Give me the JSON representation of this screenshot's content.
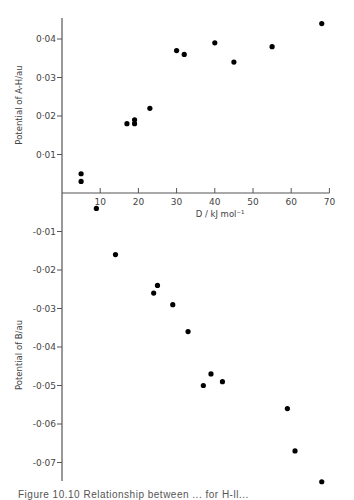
{
  "chart_data": {
    "type": "scatter",
    "title": "",
    "xlabel": "D / kJ mol⁻¹",
    "ylabel_top": "Potential of A-H/au",
    "ylabel_bottom": "Potential of B/au",
    "xlim": [
      0,
      70
    ],
    "ylim": [
      -0.076,
      0.045
    ],
    "x_ticks": [
      10,
      20,
      30,
      40,
      50,
      60,
      70
    ],
    "x_tick_labels": [
      "10",
      "20",
      "30",
      "40",
      "50",
      "60",
      "70"
    ],
    "y_ticks": [
      0.04,
      0.03,
      0.02,
      0.01,
      -0.01,
      -0.02,
      -0.03,
      -0.04,
      -0.05,
      -0.06,
      -0.07
    ],
    "y_tick_labels": [
      "0·04",
      "0·03",
      "0·02",
      "0·01",
      "-0·01",
      "-0·02",
      "-0·03",
      "-0·04",
      "-0·05",
      "-0·06",
      "-0·07"
    ],
    "grid": false,
    "legend": null,
    "series": [
      {
        "name": "Potential of A-H",
        "points": [
          {
            "x": 5,
            "y": 0.005
          },
          {
            "x": 5,
            "y": 0.003
          },
          {
            "x": 17,
            "y": 0.018
          },
          {
            "x": 19,
            "y": 0.019
          },
          {
            "x": 19,
            "y": 0.018
          },
          {
            "x": 23,
            "y": 0.022
          },
          {
            "x": 30,
            "y": 0.037
          },
          {
            "x": 32,
            "y": 0.036
          },
          {
            "x": 40,
            "y": 0.039
          },
          {
            "x": 45,
            "y": 0.034
          },
          {
            "x": 55,
            "y": 0.038
          },
          {
            "x": 68,
            "y": 0.044
          }
        ]
      },
      {
        "name": "Potential of B",
        "points": [
          {
            "x": 9,
            "y": -0.004
          },
          {
            "x": 14,
            "y": -0.016
          },
          {
            "x": 25,
            "y": -0.024
          },
          {
            "x": 24,
            "y": -0.026
          },
          {
            "x": 29,
            "y": -0.029
          },
          {
            "x": 33,
            "y": -0.036
          },
          {
            "x": 37,
            "y": -0.05
          },
          {
            "x": 39,
            "y": -0.047
          },
          {
            "x": 42,
            "y": -0.049
          },
          {
            "x": 59,
            "y": -0.056
          },
          {
            "x": 61,
            "y": -0.067
          },
          {
            "x": 68,
            "y": -0.075
          }
        ]
      }
    ]
  },
  "caption": "Figure 10.10   Relationship between ... for H-ll..."
}
